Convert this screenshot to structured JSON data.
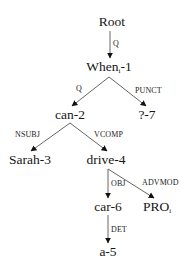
{
  "diagram": {
    "type": "dependency-tree",
    "nodes": {
      "root": {
        "label": "Root",
        "x": 112,
        "y": 22
      },
      "when": {
        "label": "When",
        "sub": "i",
        "suffix": "-1",
        "x": 109,
        "y": 67
      },
      "can": {
        "label": "can-2",
        "x": 70,
        "y": 115
      },
      "qmark": {
        "label": "?-7",
        "x": 147,
        "y": 115
      },
      "sarah": {
        "label": "Sarah-3",
        "x": 30,
        "y": 160
      },
      "drive": {
        "label": "drive-4",
        "x": 106,
        "y": 160
      },
      "car": {
        "label": "car-6",
        "x": 108,
        "y": 207
      },
      "pro": {
        "label": "PRO",
        "sub": "i",
        "x": 157,
        "y": 207
      },
      "a": {
        "label": "a-5",
        "x": 108,
        "y": 252
      }
    },
    "edges": [
      {
        "from": "root",
        "to": "when",
        "label": "Q"
      },
      {
        "from": "when",
        "to": "can",
        "label": "Q"
      },
      {
        "from": "when",
        "to": "qmark",
        "label": "PUNCT"
      },
      {
        "from": "can",
        "to": "sarah",
        "label": "NSUBJ"
      },
      {
        "from": "can",
        "to": "drive",
        "label": "VCOMP"
      },
      {
        "from": "drive",
        "to": "car",
        "label": "OBJ"
      },
      {
        "from": "drive",
        "to": "pro",
        "label": "ADVMOD"
      },
      {
        "from": "car",
        "to": "a",
        "label": "DET"
      }
    ],
    "colors": {
      "edge": "#555555",
      "arrowhead": "#111111",
      "text": "#151515",
      "background": "#ffffff"
    }
  }
}
